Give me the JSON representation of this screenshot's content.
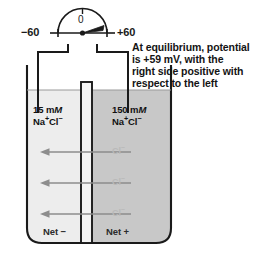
{
  "figure": {
    "meter": {
      "name": "voltmeter",
      "zero_label": "0",
      "left_scale_label": "−60",
      "right_scale_label": "+60",
      "needle_reading": "+59",
      "needle_points": "right"
    },
    "caption": {
      "lines": [
        "At equilibrium, potential",
        "is +59 mV, with the",
        "right side positive with",
        "respect to the left"
      ],
      "full_text": "At equilibrium, potential is +59 mV, with the right side positive with respect to the left"
    },
    "beaker": {
      "left_compartment": {
        "concentration_value": "15",
        "concentration_unit": "m",
        "concentration_unit_italic": "M",
        "solute_prefix": "Na",
        "solute_prefix_charge": "+",
        "solute_suffix": "Cl",
        "solute_suffix_charge": "−",
        "net_charge_label": "Net −"
      },
      "right_compartment": {
        "concentration_value": "150",
        "concentration_unit": "m",
        "concentration_unit_italic": "M",
        "solute_prefix": "Na",
        "solute_prefix_charge": "+",
        "solute_suffix": "Cl",
        "solute_suffix_charge": "−",
        "net_charge_label": "Net +"
      },
      "membrane_name": "semipermeable-membrane"
    },
    "ion_flux": {
      "species": "Cl",
      "species_charge": "−",
      "direction": "right-to-left",
      "arrow_count": 3,
      "labels": [
        "Cl",
        "Cl",
        "Cl"
      ]
    },
    "colors": {
      "background": "#ffffff",
      "left_solution": "#ededed",
      "right_solution": "#c8c8c8",
      "membrane_fill": "#f2f2f2",
      "outline": "#1a1a1a",
      "ion_label": "#b9b9b9",
      "arrow": "#8d8d8d"
    }
  }
}
